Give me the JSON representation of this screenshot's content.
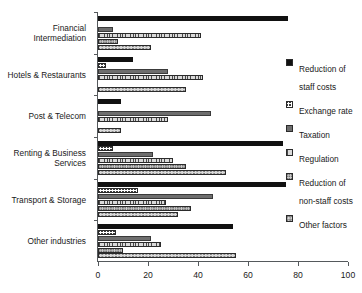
{
  "chart_data": {
    "type": "bar",
    "orientation": "horizontal",
    "title": "",
    "xlabel": "",
    "ylabel": "",
    "xlim": [
      0,
      100
    ],
    "xticks": [
      0,
      20,
      40,
      60,
      80,
      100
    ],
    "grid": false,
    "legend_position": "right",
    "categories": [
      "Financial Intermediation",
      "Hotels & Restaurants",
      "Post & Telecom",
      "Renting & Business Services",
      "Transport & Storage",
      "Other industries"
    ],
    "series": [
      {
        "name": "Reduction of staff costs",
        "pattern": "solid-black",
        "values": [
          76,
          14,
          9,
          74,
          75,
          54
        ]
      },
      {
        "name": "Exchange rate",
        "pattern": "cross-hatch",
        "values": [
          0,
          3,
          0,
          6,
          16,
          7
        ]
      },
      {
        "name": "Taxation",
        "pattern": "solid-grey",
        "values": [
          6,
          28,
          45,
          22,
          46,
          21
        ]
      },
      {
        "name": "Regulation",
        "pattern": "vertical-lines",
        "values": [
          41,
          42,
          28,
          30,
          27,
          25
        ]
      },
      {
        "name": "Reduction of non-staff costs",
        "pattern": "fine-checker",
        "values": [
          8,
          0,
          0,
          35,
          37,
          10
        ]
      },
      {
        "name": "Other factors",
        "pattern": "dotted-grey",
        "values": [
          21,
          35,
          9,
          51,
          32,
          55
        ]
      }
    ]
  },
  "legend": {
    "items": [
      "Reduction of staff costs",
      "Exchange rate",
      "Taxation",
      "Regulation",
      "Reduction of non-staff costs",
      "Other factors"
    ]
  }
}
